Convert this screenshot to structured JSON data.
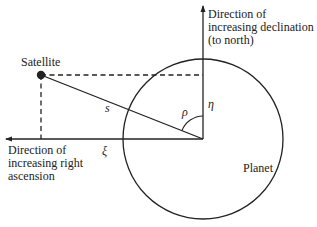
{
  "diagram": {
    "labels": {
      "satellite": "Satellite",
      "planet": "Planet",
      "declination_line1": "Direction of",
      "declination_line2": "increasing declination",
      "declination_line3": "(to north)",
      "ascension_line1": "Direction of",
      "ascension_line2": "increasing right",
      "ascension_line3": "ascension",
      "s": "s",
      "rho": "ρ",
      "eta": "η",
      "xi": "ξ"
    },
    "colors": {
      "stroke": "#222222",
      "background": "#ffffff"
    }
  }
}
